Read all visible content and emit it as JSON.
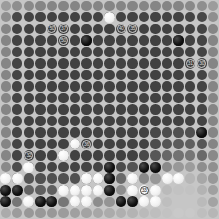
{
  "app": {
    "title": "Go Board Analysis",
    "board_size": 19,
    "view": "ownership-heatmap"
  },
  "colors": {
    "board_background": "#c6c6c6",
    "stone_black": "#000000",
    "stone_white": "#f2f2f2",
    "heat_low": "#2b2b2b",
    "heat_high": "#d0d0d0",
    "label_on_dark": "#d8d8d8",
    "label_on_light": "#202020"
  },
  "chart_data": {
    "type": "heatmap",
    "xlabel": "",
    "ylabel": "",
    "rows": 19,
    "cols": 19,
    "legend": "Grayscale cell value = estimated point ownership (dark = low, light = high)",
    "values": [
      [
        0.62,
        0.55,
        0.52,
        0.5,
        0.5,
        0.5,
        0.5,
        0.5,
        0.5,
        0.5,
        0.5,
        0.5,
        0.5,
        0.5,
        0.5,
        0.5,
        0.52,
        0.55,
        0.62
      ],
      [
        0.55,
        0.18,
        0.16,
        0.15,
        0.15,
        0.15,
        0.15,
        0.15,
        0.15,
        0.15,
        0.15,
        0.15,
        0.15,
        0.15,
        0.15,
        0.15,
        0.16,
        0.18,
        0.55
      ],
      [
        0.5,
        0.16,
        0.14,
        0.14,
        0.14,
        0.14,
        0.14,
        0.14,
        0.14,
        0.14,
        0.14,
        0.14,
        0.14,
        0.14,
        0.14,
        0.14,
        0.14,
        0.16,
        0.5
      ],
      [
        0.5,
        0.16,
        0.14,
        0.14,
        0.14,
        0.14,
        0.14,
        0.14,
        0.14,
        0.14,
        0.14,
        0.14,
        0.14,
        0.14,
        0.14,
        0.14,
        0.14,
        0.16,
        0.5
      ],
      [
        0.5,
        0.16,
        0.14,
        0.14,
        0.14,
        0.14,
        0.14,
        0.14,
        0.14,
        0.14,
        0.14,
        0.14,
        0.14,
        0.14,
        0.14,
        0.14,
        0.14,
        0.16,
        0.5
      ],
      [
        0.5,
        0.16,
        0.14,
        0.14,
        0.14,
        0.14,
        0.14,
        0.14,
        0.14,
        0.14,
        0.14,
        0.14,
        0.14,
        0.14,
        0.14,
        0.14,
        0.14,
        0.16,
        0.5
      ],
      [
        0.5,
        0.16,
        0.14,
        0.14,
        0.14,
        0.14,
        0.14,
        0.14,
        0.14,
        0.14,
        0.14,
        0.14,
        0.14,
        0.14,
        0.14,
        0.14,
        0.14,
        0.16,
        0.5
      ],
      [
        0.5,
        0.16,
        0.14,
        0.14,
        0.14,
        0.14,
        0.14,
        0.14,
        0.14,
        0.14,
        0.14,
        0.14,
        0.14,
        0.14,
        0.14,
        0.14,
        0.14,
        0.16,
        0.5
      ],
      [
        0.5,
        0.16,
        0.14,
        0.14,
        0.14,
        0.14,
        0.14,
        0.14,
        0.14,
        0.14,
        0.14,
        0.14,
        0.14,
        0.14,
        0.14,
        0.14,
        0.14,
        0.16,
        0.5
      ],
      [
        0.5,
        0.16,
        0.14,
        0.14,
        0.14,
        0.14,
        0.14,
        0.14,
        0.14,
        0.14,
        0.14,
        0.14,
        0.14,
        0.14,
        0.14,
        0.14,
        0.14,
        0.16,
        0.5
      ],
      [
        0.5,
        0.16,
        0.14,
        0.14,
        0.14,
        0.14,
        0.14,
        0.14,
        0.14,
        0.14,
        0.14,
        0.14,
        0.14,
        0.14,
        0.14,
        0.14,
        0.14,
        0.16,
        0.5
      ],
      [
        0.5,
        0.16,
        0.14,
        0.14,
        0.14,
        0.14,
        0.14,
        0.14,
        0.14,
        0.14,
        0.14,
        0.14,
        0.14,
        0.18,
        0.2,
        0.22,
        0.22,
        0.2,
        0.5
      ],
      [
        0.5,
        0.16,
        0.14,
        0.14,
        0.14,
        0.14,
        0.14,
        0.14,
        0.14,
        0.14,
        0.14,
        0.14,
        0.14,
        0.2,
        0.24,
        0.28,
        0.3,
        0.26,
        0.5
      ],
      [
        0.5,
        0.16,
        0.14,
        0.14,
        0.14,
        0.14,
        0.14,
        0.14,
        0.14,
        0.14,
        0.14,
        0.14,
        0.18,
        0.26,
        0.34,
        0.4,
        0.42,
        0.36,
        0.52
      ],
      [
        0.52,
        0.2,
        0.18,
        0.16,
        0.16,
        0.16,
        0.16,
        0.16,
        0.16,
        0.18,
        0.2,
        0.24,
        0.3,
        0.4,
        0.52,
        0.6,
        0.62,
        0.54,
        0.55
      ],
      [
        0.55,
        0.26,
        0.24,
        0.22,
        0.22,
        0.22,
        0.22,
        0.24,
        0.26,
        0.3,
        0.36,
        0.44,
        0.52,
        0.6,
        0.7,
        0.76,
        0.76,
        0.68,
        0.6
      ],
      [
        0.58,
        0.34,
        0.32,
        0.3,
        0.3,
        0.32,
        0.34,
        0.38,
        0.42,
        0.48,
        0.54,
        0.6,
        0.66,
        0.72,
        0.78,
        0.82,
        0.82,
        0.74,
        0.64
      ],
      [
        0.6,
        0.42,
        0.4,
        0.4,
        0.4,
        0.42,
        0.46,
        0.5,
        0.54,
        0.58,
        0.62,
        0.68,
        0.72,
        0.76,
        0.8,
        0.84,
        0.84,
        0.78,
        0.66
      ],
      [
        0.7,
        0.62,
        0.6,
        0.6,
        0.6,
        0.62,
        0.64,
        0.66,
        0.68,
        0.7,
        0.72,
        0.74,
        0.78,
        0.8,
        0.82,
        0.86,
        0.86,
        0.8,
        0.76
      ]
    ]
  },
  "stones": [
    {
      "col": 7,
      "row": 3,
      "color": "black"
    },
    {
      "col": 9,
      "row": 1,
      "color": "white"
    },
    {
      "col": 15,
      "row": 3,
      "color": "black"
    },
    {
      "col": 6,
      "row": 12,
      "color": "white"
    },
    {
      "col": 2,
      "row": 14,
      "color": "white"
    },
    {
      "col": 9,
      "row": 14,
      "color": "black"
    },
    {
      "col": 12,
      "row": 14,
      "color": "black"
    },
    {
      "col": 17,
      "row": 11,
      "color": "black"
    },
    {
      "col": 13,
      "row": 14,
      "color": "black"
    },
    {
      "col": 7,
      "row": 15,
      "color": "white"
    },
    {
      "col": 8,
      "row": 15,
      "color": "white"
    },
    {
      "col": 9,
      "row": 15,
      "color": "black"
    },
    {
      "col": 0,
      "row": 15,
      "color": "white"
    },
    {
      "col": 1,
      "row": 15,
      "color": "white"
    },
    {
      "col": 11,
      "row": 15,
      "color": "white"
    },
    {
      "col": 14,
      "row": 15,
      "color": "white"
    },
    {
      "col": 15,
      "row": 15,
      "color": "white"
    },
    {
      "col": 0,
      "row": 16,
      "color": "black"
    },
    {
      "col": 1,
      "row": 16,
      "color": "black"
    },
    {
      "col": 5,
      "row": 16,
      "color": "white"
    },
    {
      "col": 6,
      "row": 16,
      "color": "white"
    },
    {
      "col": 7,
      "row": 16,
      "color": "white"
    },
    {
      "col": 8,
      "row": 16,
      "color": "white"
    },
    {
      "col": 9,
      "row": 16,
      "color": "black"
    },
    {
      "col": 11,
      "row": 16,
      "color": "white"
    },
    {
      "col": 12,
      "row": 16,
      "color": "white"
    },
    {
      "col": 13,
      "row": 16,
      "color": "white"
    },
    {
      "col": 0,
      "row": 17,
      "color": "black"
    },
    {
      "col": 2,
      "row": 17,
      "color": "white"
    },
    {
      "col": 3,
      "row": 17,
      "color": "black"
    },
    {
      "col": 4,
      "row": 17,
      "color": "black"
    },
    {
      "col": 6,
      "row": 17,
      "color": "white"
    },
    {
      "col": 7,
      "row": 17,
      "color": "white"
    },
    {
      "col": 10,
      "row": 17,
      "color": "black"
    },
    {
      "col": 11,
      "row": 17,
      "color": "black"
    },
    {
      "col": 12,
      "row": 17,
      "color": "white"
    },
    {
      "col": 13,
      "row": 17,
      "color": "white"
    },
    {
      "col": 5,
      "row": 13,
      "color": "white"
    }
  ],
  "move_markers": [
    {
      "col": 4,
      "row": 2,
      "label": "50",
      "on": "dark"
    },
    {
      "col": 5,
      "row": 2,
      "label": "37",
      "on": "dark"
    },
    {
      "col": 5,
      "row": 3,
      "label": "50",
      "on": "dark"
    },
    {
      "col": 10,
      "row": 2,
      "label": "40",
      "on": "dark"
    },
    {
      "col": 11,
      "row": 2,
      "label": "35",
      "on": "dark"
    },
    {
      "col": 16,
      "row": 5,
      "label": "31",
      "on": "dark"
    },
    {
      "col": 17,
      "row": 5,
      "label": "30",
      "on": "dark"
    },
    {
      "col": 7,
      "row": 12,
      "label": "36",
      "on": "dark"
    },
    {
      "col": 2,
      "row": 13,
      "label": "32",
      "on": "dark"
    },
    {
      "col": 12,
      "row": 16,
      "label": "33",
      "on": "light"
    }
  ],
  "status": {
    "move_number": "50",
    "to_play": "white"
  }
}
